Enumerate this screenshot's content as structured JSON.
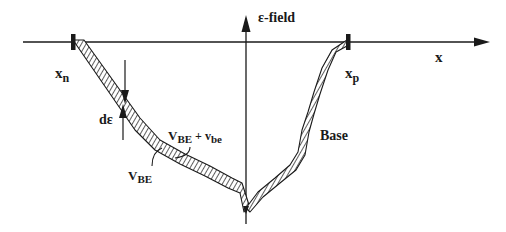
{
  "diagram": {
    "axes": {
      "vertical_label": "ε-field",
      "horizontal_label": "x"
    },
    "markers": {
      "left": {
        "main": "x",
        "sub": "n"
      },
      "right": {
        "main": "x",
        "sub": "p"
      }
    },
    "annotations": {
      "delta": "dε",
      "vbe_main": "V",
      "vbe_sub": "BE",
      "vbe_plus_main": "V",
      "vbe_plus_sub": "BE",
      "vbe_plus_op": " + v",
      "vbe_plus_sub2": "be",
      "region": "Base"
    },
    "colors": {
      "ink": "#1a1a1a",
      "background": "#ffffff"
    }
  }
}
